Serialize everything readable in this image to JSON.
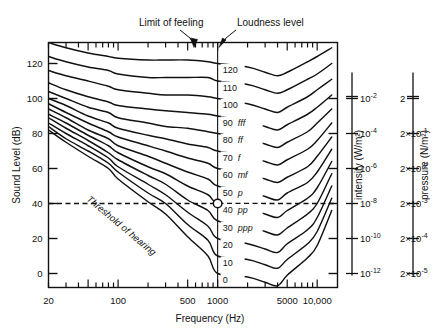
{
  "chart_data": {
    "type": "line",
    "title": "",
    "xlabel": "Frequency (Hz)",
    "ylabel": "Sound Level (dB)",
    "xscale": "log",
    "xlim": [
      20,
      16000
    ],
    "ylim": [
      -8,
      132
    ],
    "grid": false,
    "legend_position": "inline-right",
    "annotations": [
      {
        "text": "Limit of feeling",
        "target": "topmost curve near 200 Hz"
      },
      {
        "text": "Loudness level",
        "target": "curve label column at 1000 Hz"
      },
      {
        "text": "Threshold of hearing",
        "target": "lowest curve, rotated along curve"
      }
    ],
    "x_tick_labels": [
      "20",
      "100",
      "500",
      "1000",
      "5000",
      "10,000"
    ],
    "x_tick_values": [
      20,
      100,
      500,
      1000,
      5000,
      10000
    ],
    "y_tick_labels": [
      "0",
      "20",
      "40",
      "60",
      "80",
      "100",
      "120"
    ],
    "y_tick_values": [
      0,
      20,
      40,
      60,
      80,
      100,
      120
    ],
    "secondary_axes": [
      {
        "name": "intensity",
        "label": "intensity (W/m²)",
        "ticks": [
          "10−2",
          "10−4",
          "10−6",
          "10−8",
          "10−10",
          "10−12"
        ],
        "tick_db": [
          100,
          80,
          60,
          40,
          20,
          0
        ],
        "tick_mantissa": [
          "10",
          "10",
          "10",
          "10",
          "10",
          "10"
        ],
        "tick_exponent": [
          "-2",
          "-4",
          "-6",
          "-8",
          "-10",
          "-12"
        ]
      },
      {
        "name": "pressure",
        "label": "pressure (N/m²)",
        "ticks": [
          "2",
          "2×10−1",
          "2×10−2",
          "2×10−3",
          "2×10−4",
          "2×10−5"
        ],
        "tick_db": [
          100,
          80,
          60,
          40,
          20,
          0
        ],
        "tick_prefix": [
          "2",
          "2×10",
          "2×10",
          "2×10",
          "2×10",
          "2×10"
        ],
        "tick_exponent": [
          "",
          "-1",
          "-2",
          "-3",
          "-4",
          "-5"
        ]
      }
    ],
    "series": [
      {
        "name": "120 phon",
        "label": "120",
        "dynamic": "",
        "level": 120
      },
      {
        "name": "110 phon",
        "label": "110",
        "dynamic": "",
        "level": 110
      },
      {
        "name": "100 phon",
        "label": "100",
        "dynamic": "",
        "level": 100
      },
      {
        "name": "90 phon",
        "label": "90",
        "dynamic": "fff",
        "level": 90
      },
      {
        "name": "80 phon",
        "label": "80",
        "dynamic": "ff",
        "level": 80
      },
      {
        "name": "70 phon",
        "label": "70",
        "dynamic": "f",
        "level": 70
      },
      {
        "name": "60 phon",
        "label": "60",
        "dynamic": "mf",
        "level": 60
      },
      {
        "name": "50 phon",
        "label": "50",
        "dynamic": "p",
        "level": 50
      },
      {
        "name": "40 phon",
        "label": "40",
        "dynamic": "pp",
        "level": 40
      },
      {
        "name": "30 phon",
        "label": "30",
        "dynamic": "ppp",
        "level": 30
      },
      {
        "name": "20 phon",
        "label": "20",
        "dynamic": "",
        "level": 20
      },
      {
        "name": "10 phon",
        "label": "10",
        "dynamic": "",
        "level": 10
      },
      {
        "name": "0 phon",
        "label": "0",
        "dynamic": "",
        "level": 0
      }
    ],
    "reference_marker": {
      "frequency": 1000,
      "sound_level": 40,
      "style": "open circle"
    },
    "reference_line": {
      "sound_level": 40,
      "style": "dashed horizontal"
    },
    "contours_hz": [
      20,
      30,
      50,
      80,
      100,
      200,
      300,
      500,
      800,
      1000,
      2000,
      3000,
      4000,
      5000,
      8000,
      10000,
      14000
    ],
    "contours_db": {
      "120": [
        132,
        129,
        126,
        124,
        123,
        122,
        122,
        122,
        121,
        120,
        118,
        115,
        113,
        115,
        121,
        124,
        129
      ],
      "110": [
        124,
        121,
        118,
        116,
        114,
        112,
        112,
        112,
        112,
        110,
        108,
        105,
        103,
        105,
        111,
        114,
        120
      ],
      "100": [
        116,
        113,
        110,
        107,
        105,
        103,
        102,
        102,
        101,
        100,
        97,
        94,
        92,
        95,
        101,
        105,
        111
      ],
      "90": [
        109,
        105,
        101,
        98,
        96,
        94,
        93,
        92,
        91,
        90,
        87,
        84,
        82,
        85,
        91,
        95,
        102
      ],
      "80": [
        104,
        100,
        95,
        92,
        89,
        86,
        84,
        83,
        81,
        80,
        77,
        74,
        72,
        75,
        81,
        86,
        94
      ],
      "70": [
        100,
        96,
        90,
        86,
        83,
        79,
        77,
        74,
        72,
        70,
        67,
        64,
        62,
        65,
        71,
        76,
        86
      ],
      "60": [
        97,
        92,
        86,
        81,
        78,
        73,
        70,
        66,
        63,
        60,
        57,
        54,
        52,
        55,
        61,
        67,
        78
      ],
      "50": [
        94,
        89,
        82,
        77,
        73,
        67,
        63,
        58,
        54,
        50,
        47,
        44,
        42,
        46,
        52,
        58,
        71
      ],
      "40": [
        91,
        86,
        79,
        73,
        69,
        61,
        57,
        50,
        45,
        40,
        37,
        34,
        32,
        36,
        43,
        49,
        64
      ],
      "30": [
        89,
        83,
        76,
        69,
        65,
        56,
        51,
        42,
        36,
        30,
        27,
        24,
        22,
        26,
        34,
        40,
        57
      ],
      "20": [
        86,
        80,
        73,
        66,
        61,
        51,
        45,
        35,
        27,
        20,
        17,
        14,
        12,
        17,
        25,
        32,
        50
      ],
      "10": [
        84,
        77,
        70,
        63,
        58,
        46,
        40,
        28,
        19,
        10,
        8,
        5,
        3,
        8,
        17,
        24,
        43
      ],
      "0": [
        82,
        75,
        67,
        60,
        54,
        41,
        34,
        21,
        10,
        0,
        -2,
        -5,
        -7,
        -1,
        9,
        16,
        36
      ]
    }
  },
  "axes": {
    "y_title": "Sound Level (dB)",
    "x_title": "Frequency (Hz)",
    "intensity_title": "intensity (W/m²)",
    "pressure_title": "pressure (N/m²)"
  },
  "annotations": {
    "limit_of_feeling": "Limit of feeling",
    "loudness_level": "Loudness level",
    "threshold_of_hearing": "Threshold of hearing"
  },
  "colors": {
    "ink": "#111111",
    "background": "#ffffff",
    "frame": "#000000"
  }
}
